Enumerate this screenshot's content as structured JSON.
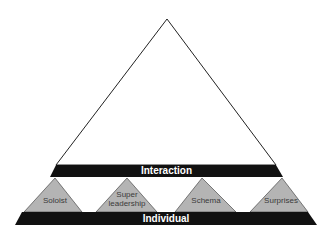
{
  "diagram": {
    "type": "pyramid",
    "top_band": "Interaction",
    "bottom_band": "Individual",
    "sub_triangles": [
      {
        "label": "Soloist"
      },
      {
        "label": "Super leadership",
        "line1": "Super",
        "line2": "leadership"
      },
      {
        "label": "Schema"
      },
      {
        "label": "Surprises"
      }
    ],
    "colors": {
      "band": "#111111",
      "sub_triangle_fill": "#b4b4b4",
      "outline": "#222222",
      "background": "#ffffff"
    }
  }
}
